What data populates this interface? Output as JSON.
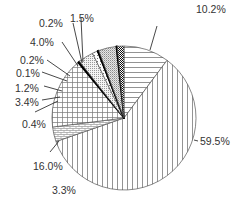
{
  "chart_data": {
    "type": "pie",
    "title": "",
    "start_angle_deg": -90,
    "direction": "clockwise",
    "center": [
      124,
      118
    ],
    "radius": 72,
    "slices": [
      {
        "label": "10.2%",
        "value": 10.2,
        "pattern": "hlines"
      },
      {
        "label": "59.5%",
        "value": 59.5,
        "pattern": "vlines"
      },
      {
        "label": "3.3%",
        "value": 3.3,
        "pattern": "brick"
      },
      {
        "label": "16.0%",
        "value": 16.0,
        "pattern": "grid"
      },
      {
        "label": "0.4%",
        "value": 0.4,
        "pattern": "dark"
      },
      {
        "label": "3.4%",
        "value": 3.4,
        "pattern": "fine-dots"
      },
      {
        "label": "1.2%",
        "value": 1.2,
        "pattern": "dots"
      },
      {
        "label": "0.1%",
        "value": 0.1,
        "pattern": "solid-black"
      },
      {
        "label": "0.2%",
        "value": 0.2,
        "pattern": "solid-black"
      },
      {
        "label": "4.0%",
        "value": 4.0,
        "pattern": "stipple"
      },
      {
        "label": "0.2%",
        "value": 0.2,
        "pattern": "dark"
      },
      {
        "label": "1.5%",
        "value": 1.5,
        "pattern": "checker"
      }
    ],
    "labels": [
      {
        "text": "10.2%",
        "x": 196,
        "y": 3,
        "anchor_x": 150,
        "anchor_y": 50,
        "elbow_x": 157,
        "elbow_y": 26
      },
      {
        "text": "59.5%",
        "x": 200,
        "y": 135,
        "anchor_x": 194,
        "anchor_y": 140,
        "elbow_x": 198,
        "elbow_y": 141
      },
      {
        "text": "3.3%",
        "x": 52,
        "y": 184,
        "anchor_x": 90,
        "anchor_y": 180,
        "elbow_x": 90,
        "elbow_y": 180
      },
      {
        "text": "16.0%",
        "x": 33,
        "y": 160,
        "anchor_x": 59,
        "anchor_y": 141,
        "elbow_x": 50,
        "elbow_y": 152
      },
      {
        "text": "0.4%",
        "x": 22,
        "y": 118,
        "anchor_x": 58,
        "anchor_y": 101,
        "elbow_x": 35,
        "elbow_y": 112
      },
      {
        "text": "3.4%",
        "x": 15,
        "y": 96,
        "anchor_x": 60,
        "anchor_y": 97,
        "elbow_x": 42,
        "elbow_y": 100
      },
      {
        "text": "1.2%",
        "x": 15,
        "y": 82,
        "anchor_x": 62,
        "anchor_y": 91,
        "elbow_x": 44,
        "elbow_y": 86
      },
      {
        "text": "0.1%",
        "x": 16,
        "y": 67,
        "anchor_x": 67,
        "anchor_y": 81,
        "elbow_x": 42,
        "elbow_y": 72
      },
      {
        "text": "0.2%",
        "x": 20,
        "y": 54,
        "anchor_x": 70,
        "anchor_y": 76,
        "elbow_x": 47,
        "elbow_y": 60
      },
      {
        "text": "4.0%",
        "x": 30,
        "y": 36,
        "anchor_x": 78,
        "anchor_y": 66,
        "elbow_x": 62,
        "elbow_y": 42
      },
      {
        "text": "0.2%",
        "x": 39,
        "y": 17,
        "anchor_x": 82,
        "anchor_y": 63,
        "elbow_x": 73,
        "elbow_y": 23
      },
      {
        "text": "1.5%",
        "x": 70,
        "y": 12,
        "anchor_x": 83,
        "anchor_y": 62,
        "elbow_x": 81,
        "elbow_y": 18
      }
    ],
    "legend": null,
    "colors": {
      "stroke": "#555555",
      "line": "#777777",
      "text": "#333333"
    }
  }
}
